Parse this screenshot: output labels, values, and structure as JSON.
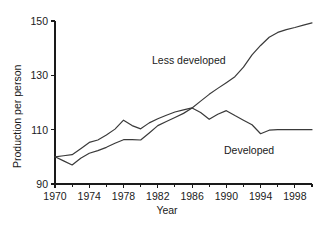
{
  "figure": {
    "background_color": "#ffffff",
    "line_color": "#3a3a3a",
    "axis_color": "#1a1a1a",
    "text_color": "#1a1a1a"
  },
  "axes": {
    "x_title": "Year",
    "y_title": "Production per person",
    "x_tick_labels": [
      "1970",
      "1974",
      "1978",
      "1982",
      "1986",
      "1990",
      "1994",
      "1998"
    ],
    "x_tick_values": [
      1970,
      1974,
      1978,
      1982,
      1986,
      1990,
      1994,
      1998
    ],
    "x_minor_tick_values": [
      1972,
      1976,
      1980,
      1984,
      1988,
      1992,
      1996,
      2000
    ],
    "y_tick_labels": [
      "90",
      "110",
      "130",
      "150"
    ],
    "y_tick_values": [
      90,
      110,
      130,
      150
    ]
  },
  "annotations": {
    "less_developed": "Less developed",
    "developed": "Developed"
  },
  "chart_data": {
    "type": "line",
    "title": "",
    "subtitle": "",
    "xlabel": "Year",
    "ylabel": "Production per person",
    "xlim": [
      1970,
      2000
    ],
    "ylim": [
      90,
      150
    ],
    "xticks": [
      1970,
      1974,
      1978,
      1982,
      1986,
      1990,
      1994,
      1998
    ],
    "yticks": [
      90,
      110,
      130,
      150
    ],
    "grid": false,
    "legend": "inline-annotations",
    "x": [
      1970,
      1971,
      1972,
      1973,
      1974,
      1975,
      1976,
      1977,
      1978,
      1979,
      1980,
      1981,
      1982,
      1983,
      1984,
      1985,
      1986,
      1987,
      1988,
      1989,
      1990,
      1991,
      1992,
      1993,
      1994,
      1995,
      1996,
      1997,
      1998,
      1999,
      2000
    ],
    "series": [
      {
        "name": "Developed",
        "values": [
          100.0,
          100.4,
          100.8,
          103.0,
          105.3,
          106.2,
          108.0,
          110.2,
          113.5,
          111.5,
          110.3,
          112.5,
          114.0,
          115.3,
          116.5,
          117.3,
          118.0,
          116.3,
          113.8,
          115.7,
          117.0,
          115.2,
          113.5,
          111.8,
          108.5,
          109.8,
          110.0,
          110.0,
          110.0,
          110.0,
          110.0
        ]
      },
      {
        "name": "Less developed",
        "values": [
          100.0,
          98.5,
          97.0,
          99.5,
          101.3,
          102.3,
          103.5,
          105.0,
          106.3,
          106.3,
          106.2,
          108.8,
          111.5,
          113.0,
          114.5,
          116.0,
          118.0,
          120.5,
          123.0,
          125.2,
          127.3,
          129.5,
          133.0,
          137.5,
          141.0,
          144.0,
          145.8,
          146.8,
          147.6,
          148.5,
          149.3
        ]
      }
    ]
  }
}
